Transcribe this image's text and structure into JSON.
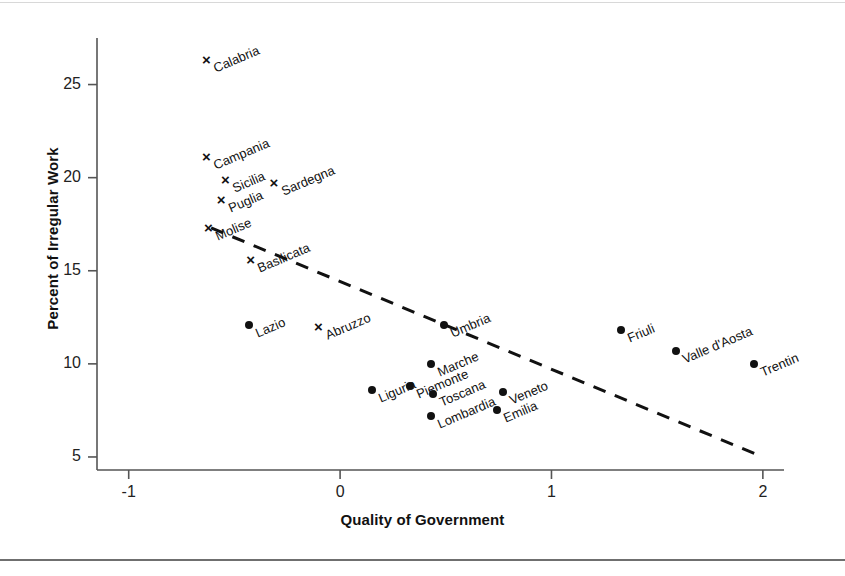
{
  "chart_data": {
    "type": "scatter",
    "title": "",
    "xlabel": "Quality of Government",
    "ylabel": "Percent of Irregular Work",
    "xlim": [
      -1.15,
      2.1
    ],
    "ylim": [
      4.3,
      27.5
    ],
    "xticks": [
      "-1",
      "0",
      "1",
      "2"
    ],
    "xtick_values": [
      -1,
      0,
      1,
      2
    ],
    "yticks": [
      "5",
      "10",
      "15",
      "20",
      "25"
    ],
    "ytick_values": [
      5,
      10,
      15,
      20,
      25
    ],
    "grid": false,
    "legend": "none",
    "marker_styles": {
      "south": "x",
      "north": "dot"
    },
    "points": [
      {
        "label": "Calabria",
        "x": -0.63,
        "y": 26.3,
        "marker": "x"
      },
      {
        "label": "Campania",
        "x": -0.63,
        "y": 21.1,
        "marker": "x"
      },
      {
        "label": "Sicilia",
        "x": -0.54,
        "y": 19.9,
        "marker": "x"
      },
      {
        "label": "Sardegna",
        "x": -0.31,
        "y": 19.7,
        "marker": "x"
      },
      {
        "label": "Puglia",
        "x": -0.56,
        "y": 18.8,
        "marker": "x"
      },
      {
        "label": "Molise",
        "x": -0.62,
        "y": 17.3,
        "marker": "x"
      },
      {
        "label": "Basilicata",
        "x": -0.42,
        "y": 15.6,
        "marker": "x"
      },
      {
        "label": "Abruzzo",
        "x": -0.1,
        "y": 12.0,
        "marker": "x"
      },
      {
        "label": "Lazio",
        "x": -0.43,
        "y": 12.1,
        "marker": "dot"
      },
      {
        "label": "Umbria",
        "x": 0.49,
        "y": 12.1,
        "marker": "dot"
      },
      {
        "label": "Friuli",
        "x": 1.33,
        "y": 11.8,
        "marker": "dot"
      },
      {
        "label": "Valle d'Aosta",
        "x": 1.59,
        "y": 10.7,
        "marker": "dot"
      },
      {
        "label": "Trentin",
        "x": 1.96,
        "y": 10.0,
        "marker": "dot"
      },
      {
        "label": "Marche",
        "x": 0.43,
        "y": 10.0,
        "marker": "dot"
      },
      {
        "label": "Liguria",
        "x": 0.15,
        "y": 8.6,
        "marker": "dot"
      },
      {
        "label": "Piemonte",
        "x": 0.33,
        "y": 8.8,
        "marker": "dot"
      },
      {
        "label": "Toscana",
        "x": 0.44,
        "y": 8.4,
        "marker": "dot"
      },
      {
        "label": "Veneto",
        "x": 0.77,
        "y": 8.5,
        "marker": "dot"
      },
      {
        "label": "Lombardia",
        "x": 0.43,
        "y": 7.2,
        "marker": "dot"
      },
      {
        "label": "Emilia",
        "x": 0.74,
        "y": 7.5,
        "marker": "dot"
      }
    ],
    "trend_line": {
      "style": "dashed",
      "x_start": -0.61,
      "y_start": 17.3,
      "x_end": 2.0,
      "y_end": 5.0
    }
  },
  "axes": {
    "x_title": "Quality of Government",
    "y_title": "Percent of Irregular Work"
  }
}
